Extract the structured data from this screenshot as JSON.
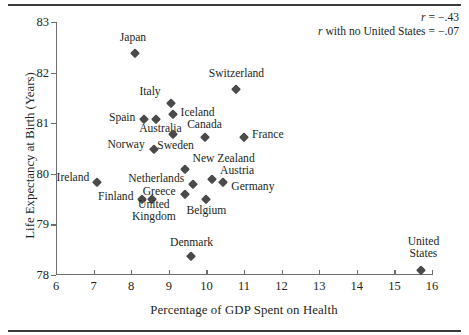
{
  "chart_data": {
    "type": "scatter",
    "title": "",
    "xlabel": "Percentage of GDP Spent on Health",
    "ylabel": "Life Expectancy at Birth (Years)",
    "xlim": [
      6,
      16
    ],
    "ylim": [
      78,
      83
    ],
    "xticks": [
      "6",
      "7",
      "8",
      "9",
      "10",
      "11",
      "12",
      "13",
      "14",
      "15",
      "16"
    ],
    "yticks": [
      "78",
      "79",
      "80",
      "81",
      "82",
      "83"
    ],
    "grid": false,
    "legend": "none",
    "marker": "diamond",
    "marker_color": "#4a4a4a",
    "points": [
      {
        "label": "Japan",
        "x": 8.1,
        "y": 82.38,
        "lx": -2,
        "ly": -15,
        "align": "center"
      },
      {
        "label": "Switzerland",
        "x": 10.8,
        "y": 81.67,
        "lx": 0,
        "ly": -15,
        "align": "center"
      },
      {
        "label": "Italy",
        "x": 9.05,
        "y": 81.4,
        "lx": -10,
        "ly": -11,
        "align": "right"
      },
      {
        "label": "Iceland",
        "x": 9.1,
        "y": 81.18,
        "lx": 8,
        "ly": -1,
        "align": "left"
      },
      {
        "label": "Spain",
        "x": 8.35,
        "y": 81.08,
        "lx": -9,
        "ly": -1,
        "align": "right"
      },
      {
        "label": "Australia",
        "x": 8.67,
        "y": 81.08,
        "lx": 4,
        "ly": 10,
        "align": "center"
      },
      {
        "label": "Sweden",
        "x": 9.1,
        "y": 80.78,
        "lx": 3,
        "ly": 12,
        "align": "center"
      },
      {
        "label": "Canada",
        "x": 9.95,
        "y": 80.72,
        "lx": 0,
        "ly": -12,
        "align": "center"
      },
      {
        "label": "France",
        "x": 11.0,
        "y": 80.72,
        "lx": 8,
        "ly": -2,
        "align": "left"
      },
      {
        "label": "Norway",
        "x": 8.6,
        "y": 80.5,
        "lx": -9,
        "ly": -4,
        "align": "right"
      },
      {
        "label": "New Zealand",
        "x": 9.42,
        "y": 80.1,
        "lx": 8,
        "ly": -10,
        "align": "left"
      },
      {
        "label": "Ireland",
        "x": 7.1,
        "y": 79.83,
        "lx": -8,
        "ly": -4,
        "align": "right"
      },
      {
        "label": "Netherlands",
        "x": 9.65,
        "y": 79.8,
        "lx": -9,
        "ly": -5,
        "align": "right"
      },
      {
        "label": "Austria",
        "x": 10.15,
        "y": 79.9,
        "lx": 8,
        "ly": -8,
        "align": "left"
      },
      {
        "label": "Germany",
        "x": 10.45,
        "y": 79.83,
        "lx": 8,
        "ly": 5,
        "align": "left"
      },
      {
        "label": "Greece",
        "x": 9.42,
        "y": 79.6,
        "lx": -9,
        "ly": -2,
        "align": "right"
      },
      {
        "label": "Finland",
        "x": 8.3,
        "y": 79.5,
        "lx": -9,
        "ly": -2,
        "align": "right"
      },
      {
        "label": "United\nKingdom",
        "x": 8.55,
        "y": 79.5,
        "lx": 2,
        "ly": 12,
        "align": "center"
      },
      {
        "label": "Belgium",
        "x": 10.0,
        "y": 79.5,
        "lx": 0,
        "ly": 12,
        "align": "center"
      },
      {
        "label": "Denmark",
        "x": 9.58,
        "y": 78.38,
        "lx": 1,
        "ly": -13,
        "align": "center"
      },
      {
        "label": "United\nStates",
        "x": 15.72,
        "y": 78.1,
        "lx": 2,
        "ly": -22,
        "align": "center"
      }
    ],
    "annotations": [
      {
        "text": "r = −.43",
        "italic_prefix": "r",
        "rest": " = −.43"
      },
      {
        "text": "r with no United States = −.07",
        "italic_prefix": "r",
        "rest": " with no United States = −.07"
      }
    ]
  }
}
